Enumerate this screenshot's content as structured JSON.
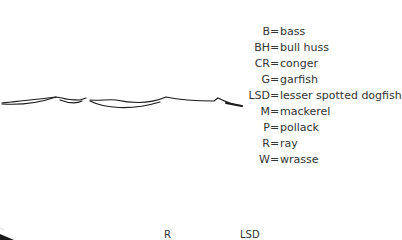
{
  "legend": {
    "items": [
      {
        "code": "B",
        "name": "bass"
      },
      {
        "code": "BH",
        "name": "bull huss"
      },
      {
        "code": "CR",
        "name": "conger"
      },
      {
        "code": "G",
        "name": "garfish"
      },
      {
        "code": "LSD",
        "name": "lesser spotted dogfish"
      },
      {
        "code": "M",
        "name": "mackerel"
      },
      {
        "code": "P",
        "name": "pollack"
      },
      {
        "code": "R",
        "name": "ray"
      },
      {
        "code": "W",
        "name": "wrasse"
      }
    ],
    "separator": "="
  },
  "map_labels": [
    {
      "text": "R",
      "x": 164,
      "y": 229
    },
    {
      "text": "LSD",
      "x": 240,
      "y": 229
    }
  ],
  "colors": {
    "ink": "#1a1a1a",
    "text": "#333333",
    "background": "#ffffff"
  }
}
